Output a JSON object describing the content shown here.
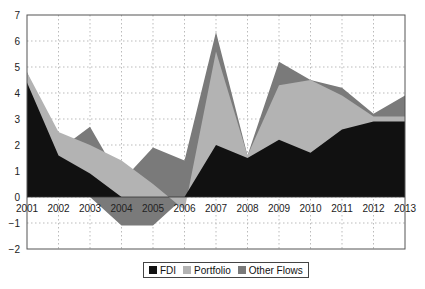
{
  "chart_data": {
    "type": "area",
    "title": "",
    "xlabel": "",
    "ylabel": "",
    "categories": [
      "2001",
      "2002",
      "2003",
      "2004",
      "2005",
      "2006",
      "2007",
      "2008",
      "2009",
      "2010",
      "2011",
      "2012",
      "2013"
    ],
    "ylim": [
      -2,
      7
    ],
    "yticks": [
      -2,
      -1,
      0,
      1,
      2,
      3,
      4,
      5,
      6,
      7
    ],
    "ytick_labels": [
      "−2",
      "−1",
      "0",
      "1",
      "2",
      "3",
      "4",
      "5",
      "6",
      "7"
    ],
    "grid": true,
    "legend_position": "bottom",
    "series": [
      {
        "name": "Other Flows",
        "color": "#7a7a7a",
        "values": [
          4.8,
          1.8,
          2.7,
          0.6,
          1.9,
          1.4,
          6.35,
          1.6,
          5.2,
          4.5,
          4.2,
          3.2,
          3.9
        ],
        "lower": [
          0,
          0,
          0,
          -1.1,
          -1.1,
          0,
          0,
          0,
          0,
          0,
          0,
          0,
          0
        ]
      },
      {
        "name": "Portfolio",
        "color": "#b3b3b3",
        "values": [
          4.8,
          2.5,
          2.0,
          1.4,
          0.5,
          -0.5,
          5.6,
          1.6,
          4.3,
          4.5,
          3.9,
          3.1,
          3.1
        ]
      },
      {
        "name": "FDI",
        "color": "#111111",
        "values": [
          4.4,
          1.6,
          0.9,
          0.0,
          0.0,
          0.0,
          2.0,
          1.5,
          2.2,
          1.7,
          2.6,
          2.9,
          2.9
        ]
      }
    ]
  },
  "legend": {
    "items": [
      {
        "label": "FDI",
        "color": "#111111"
      },
      {
        "label": "Portfolio",
        "color": "#b3b3b3"
      },
      {
        "label": "Other Flows",
        "color": "#7a7a7a"
      }
    ]
  }
}
